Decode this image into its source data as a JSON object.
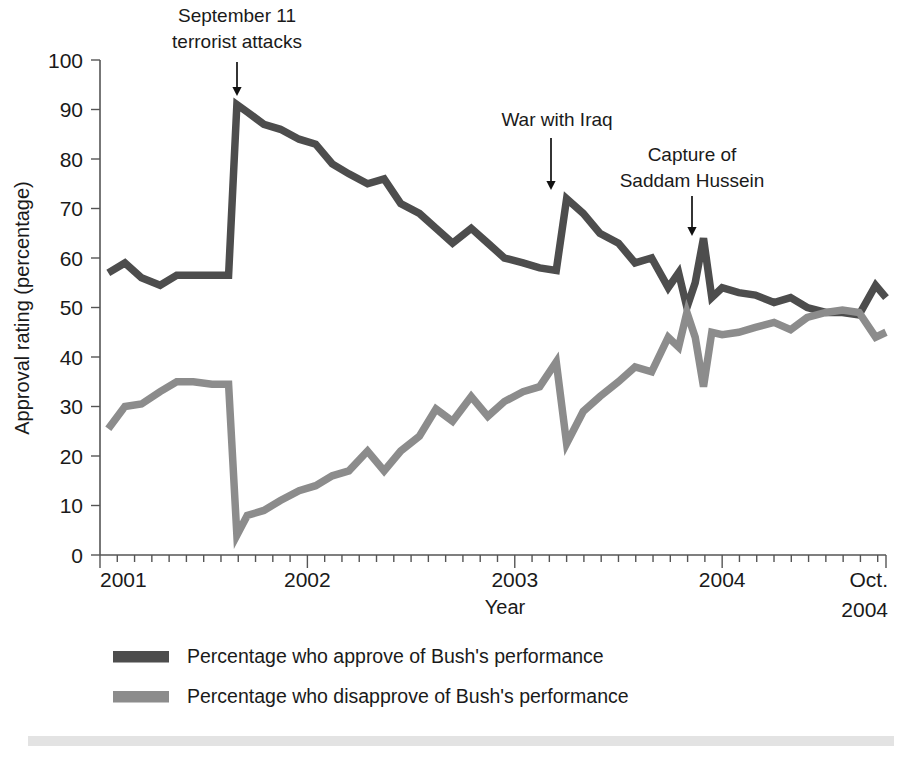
{
  "chart_data": {
    "type": "line",
    "title": "",
    "xlabel": "Year",
    "ylabel": "Approval rating (percentage)",
    "ylim": [
      0,
      100
    ],
    "ytick_values": [
      0,
      10,
      20,
      30,
      40,
      50,
      60,
      70,
      80,
      90,
      100
    ],
    "ytick_labels": [
      "0",
      "10",
      "20",
      "30",
      "40",
      "50",
      "60",
      "70",
      "80",
      "90",
      "100"
    ],
    "xlim": [
      2001.0,
      2004.79
    ],
    "xtick_values": [
      2001,
      2002,
      2003,
      2004,
      2004.79
    ],
    "xtick_labels": [
      "2001",
      "2002",
      "2003",
      "2004",
      "Oct.\n2004"
    ],
    "xtick_label_last_line1": "Oct.",
    "xtick_label_last_line2": "2004",
    "grid": false,
    "legend_position": "below-plot",
    "minor_ticks": "monthly",
    "series": [
      {
        "name": "Percentage who approve of Bush's performance",
        "color": "#4d4d4d",
        "x": [
          2001.04,
          2001.12,
          2001.2,
          2001.29,
          2001.37,
          2001.45,
          2001.54,
          2001.62,
          2001.66,
          2001.71,
          2001.79,
          2001.87,
          2001.96,
          2002.04,
          2002.12,
          2002.2,
          2002.29,
          2002.37,
          2002.45,
          2002.54,
          2002.62,
          2002.7,
          2002.79,
          2002.87,
          2002.95,
          2003.04,
          2003.12,
          2003.2,
          2003.25,
          2003.33,
          2003.41,
          2003.5,
          2003.58,
          2003.66,
          2003.74,
          2003.79,
          2003.83,
          2003.87,
          2003.91,
          2003.95,
          2004.0,
          2004.08,
          2004.16,
          2004.25,
          2004.33,
          2004.41,
          2004.5,
          2004.58,
          2004.66,
          2004.74,
          2004.79
        ],
        "y": [
          57,
          59,
          56,
          54.5,
          56.5,
          56.5,
          56.5,
          56.5,
          91,
          89.5,
          87,
          86,
          84,
          83,
          79,
          77,
          75,
          76,
          71,
          69,
          66,
          63,
          66,
          63,
          60,
          59,
          58,
          57.5,
          72,
          69,
          65,
          63,
          59,
          60,
          54,
          57,
          50,
          55,
          64,
          52,
          54,
          53,
          52.5,
          51,
          52,
          50,
          49,
          49,
          48.5,
          54.5,
          52
        ]
      },
      {
        "name": "Percentage who disapprove of Bush's performance",
        "color": "#8c8c8c",
        "x": [
          2001.04,
          2001.12,
          2001.2,
          2001.29,
          2001.37,
          2001.45,
          2001.54,
          2001.62,
          2001.66,
          2001.71,
          2001.79,
          2001.87,
          2001.96,
          2002.04,
          2002.12,
          2002.2,
          2002.29,
          2002.37,
          2002.45,
          2002.54,
          2002.62,
          2002.7,
          2002.79,
          2002.87,
          2002.95,
          2003.04,
          2003.12,
          2003.2,
          2003.25,
          2003.33,
          2003.41,
          2003.5,
          2003.58,
          2003.66,
          2003.74,
          2003.79,
          2003.83,
          2003.87,
          2003.91,
          2003.95,
          2004.0,
          2004.08,
          2004.16,
          2004.25,
          2004.33,
          2004.41,
          2004.5,
          2004.58,
          2004.66,
          2004.74,
          2004.79
        ],
        "y": [
          25.5,
          30,
          30.5,
          33,
          35,
          35,
          34.5,
          34.5,
          4,
          8,
          9,
          11,
          13,
          14,
          16,
          17,
          21,
          17,
          21,
          24,
          29.5,
          27,
          32,
          28,
          31,
          33,
          34,
          39,
          22.5,
          29,
          32,
          35,
          38,
          37,
          44,
          42,
          49,
          44,
          34,
          45,
          44.5,
          45,
          46,
          47,
          45.5,
          48,
          49,
          49.5,
          49,
          44,
          45
        ]
      }
    ],
    "annotations": [
      {
        "id": "september-11",
        "lines": [
          "September 11",
          "terrorist attacks"
        ],
        "target_x": 2001.655,
        "target_y": 94,
        "text_x": 237,
        "text_y": 22,
        "text_anchor": "middle",
        "arrow_x": 237,
        "arrow_y0": 62,
        "arrow_y1": 96
      },
      {
        "id": "war-with-iraq",
        "lines": [
          "War with Iraq"
        ],
        "target_x": 2003.25,
        "target_y": 75,
        "text_x": 557,
        "text_y": 126,
        "text_anchor": "middle",
        "arrow_x": 551,
        "arrow_y0": 138,
        "arrow_y1": 190
      },
      {
        "id": "capture-of-saddam-hussein",
        "lines": [
          "Capture of",
          "Saddam Hussein"
        ],
        "target_x": 2003.91,
        "target_y": 67,
        "text_x": 692,
        "text_y": 161,
        "text_anchor": "middle",
        "arrow_x": 692,
        "arrow_y0": 196,
        "arrow_y1": 236
      }
    ],
    "legend": [
      {
        "label": "Percentage who approve of Bush's performance",
        "color": "#4d4d4d"
      },
      {
        "label": "Percentage who disapprove of Bush's performance",
        "color": "#8c8c8c"
      }
    ]
  },
  "colors": {
    "approve": "#4d4d4d",
    "disapprove": "#8c8c8c",
    "axis": "#555555",
    "text": "#1a1a1a",
    "footer_bar": "#e3e3e3",
    "background": "#ffffff"
  }
}
